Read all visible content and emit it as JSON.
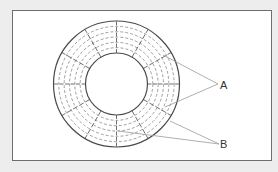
{
  "diagram": {
    "type": "disk-tracks-sectors",
    "colors": {
      "background": "#ededed",
      "panel": "#ffffff",
      "frame": "#6e6e6e",
      "stroke": "#4a4a4a",
      "dashed": "#777777",
      "leader": "#9a9a9a",
      "text": "#333333"
    },
    "disk": {
      "center": [
        116.5,
        84
      ],
      "outer_radius": 63,
      "inner_radius": 31,
      "track_count": 5,
      "sector_count": 12
    },
    "labels": [
      {
        "id": "A",
        "text": "A",
        "x": 220,
        "y": 79,
        "pointer_origin": [
          218,
          84
        ],
        "targets": [
          [
            163,
            55
          ],
          [
            165,
            107
          ]
        ]
      },
      {
        "id": "B",
        "text": "B",
        "x": 220,
        "y": 138,
        "pointer_origin": [
          219,
          144
        ],
        "targets": [
          [
            170,
            121
          ],
          [
            118,
            131
          ]
        ]
      }
    ]
  }
}
